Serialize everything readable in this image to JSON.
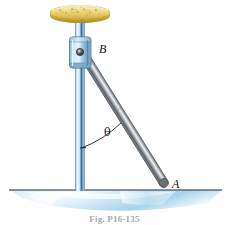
{
  "figure": {
    "caption": "Fig. P16-135",
    "background_color": "#ffffff",
    "labels": {
      "pivot_point": "B",
      "contact_point": "A",
      "angle": "θ"
    },
    "parts": {
      "disc": {
        "name": "yellow-disc",
        "description": "textured gold disc atop the pole",
        "color_light": "#f7e8a8",
        "color_mid": "#e8cf6a",
        "color_dark": "#c9a83c",
        "center_x": 80,
        "center_y": 13,
        "radius_x": 30,
        "radius_y": 7
      },
      "pole": {
        "name": "vertical-pole",
        "color_light": "#cfe4f4",
        "color_mid": "#6aa6d2",
        "color_dark": "#2c5f8a",
        "top_y": 12,
        "bottom_y": 190,
        "center_x": 80,
        "width": 9
      },
      "collar": {
        "name": "collar-block",
        "color_light": "#d4e7f6",
        "color_mid": "#7fb0d4",
        "color_dark": "#3d6f9c",
        "x": 70,
        "y": 37,
        "width": 21,
        "height": 31
      },
      "pin": {
        "name": "pin-joint",
        "color": "#3f4952",
        "center_x": 80,
        "center_y": 52,
        "radius": 3.4
      },
      "rod": {
        "name": "slender-rod",
        "color_light": "#c9ccd0",
        "color_mid": "#8f949a",
        "color_dark": "#50565c",
        "from_x": 82,
        "from_y": 52,
        "to_x": 167,
        "to_y": 188,
        "thickness": 9
      },
      "ground": {
        "name": "water-ground-plane",
        "color_line": "#2b2f33",
        "color_light": "#eef7fc",
        "color_mid": "#bddff2",
        "color_dark": "#8cc6e8",
        "line_y": 190,
        "left_x": 8,
        "right_x": 222
      },
      "angle_arc": {
        "name": "angle-arc",
        "color": "#1a1d20",
        "vertex_x": 80,
        "vertex_y": 148,
        "radius": 36
      }
    }
  }
}
